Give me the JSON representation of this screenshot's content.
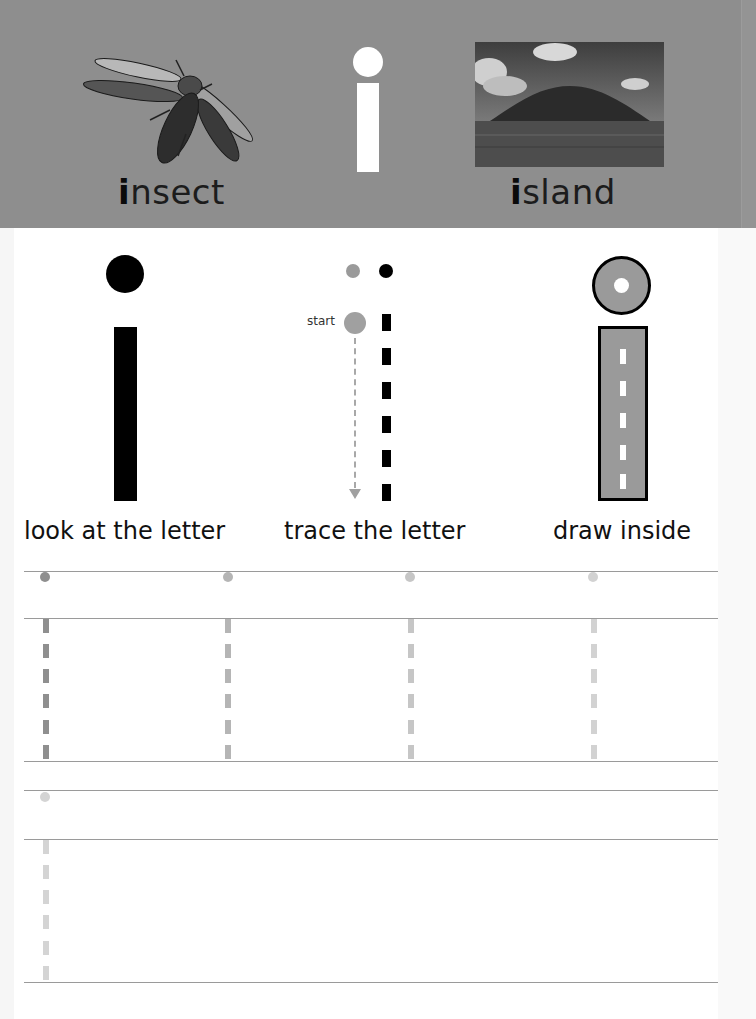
{
  "header": {
    "letter": "i",
    "words": [
      {
        "first": "i",
        "rest": "nsect",
        "full": "insect",
        "picture": "insect-photo"
      },
      {
        "first": "i",
        "rest": "sland",
        "full": "island",
        "picture": "island-photo"
      }
    ],
    "band_color": "#8e8e8e"
  },
  "steps": [
    {
      "caption": "look at the letter"
    },
    {
      "caption": "trace the letter",
      "start_label": "start"
    },
    {
      "caption": "draw inside"
    }
  ],
  "practice": {
    "rows": [
      {
        "guides": [
          {
            "x": 43,
            "dot_color": "#8f8f8f",
            "dash_color": "#8f8f8f"
          },
          {
            "x": 226,
            "dot_color": "#b5b5b5",
            "dash_color": "#b5b5b5"
          },
          {
            "x": 408,
            "dot_color": "#c6c6c6",
            "dash_color": "#c6c6c6"
          },
          {
            "x": 591,
            "dot_color": "#d2d2d2",
            "dash_color": "#d2d2d2"
          }
        ]
      },
      {
        "guides": [
          {
            "x": 43,
            "dot_color": "#d4d4d4",
            "dash_color": "#d4d4d4"
          }
        ]
      }
    ]
  }
}
